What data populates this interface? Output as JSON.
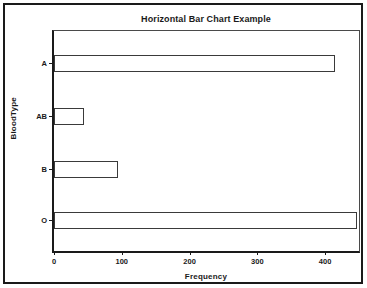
{
  "chart_data": {
    "type": "bar",
    "orientation": "horizontal",
    "title": "Horizontal Bar Chart Example",
    "xlabel": "Frequency",
    "ylabel": "BloodType",
    "categories": [
      "A",
      "AB",
      "B",
      "O"
    ],
    "values": [
      415,
      44,
      95,
      447
    ],
    "xlim": [
      0,
      450
    ],
    "xticks": [
      0,
      100,
      200,
      300,
      400
    ],
    "xtick_labels": [
      "0",
      "100",
      "200",
      "300",
      "400"
    ],
    "grid": false,
    "legend": null,
    "bar_fill_color": "#ffffff",
    "bar_edge_color": "#3a3a3a",
    "axis_color": "#1a1a1a",
    "background_color": "#ffffff",
    "frame_color": "#1a1a1a"
  },
  "axes": {
    "y_title": "BloodType",
    "x_title": "Frequency"
  }
}
